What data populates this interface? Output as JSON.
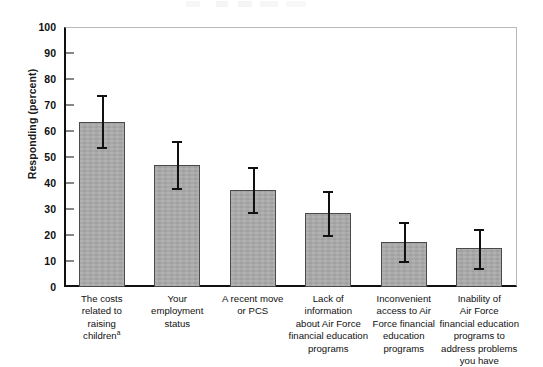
{
  "figure": {
    "y_axis_title": "Responding (percent)"
  },
  "chart_data": {
    "type": "bar",
    "title": "",
    "subtitle": "",
    "xlabel": "",
    "ylabel": "Responding (percent)",
    "ylim": [
      0,
      100
    ],
    "yticks": [
      0,
      10,
      20,
      30,
      40,
      50,
      60,
      70,
      80,
      90,
      100
    ],
    "ytick_labels": [
      "0",
      "10",
      "20",
      "30",
      "40",
      "50",
      "60",
      "70",
      "80",
      "90",
      "100"
    ],
    "grid": false,
    "legend": "none",
    "bar_color": "#a9a9a9",
    "bar_edge_color": "#4a4a4a",
    "error_bar_color": "#111111",
    "categories": [
      "The costs related to raising children",
      "Your employment status",
      "A recent move or PCS",
      "Lack of information about Air Force financial education programs",
      "Inconvenient access to Air Force financial education programs",
      "Inability of Air Force financial education programs to address problems you have"
    ],
    "category_lines": [
      [
        "The costs",
        "related to",
        "raising",
        "children"
      ],
      [
        "Your",
        "employment",
        "status"
      ],
      [
        "A recent move",
        "or PCS"
      ],
      [
        "Lack of",
        "information",
        "about Air Force",
        "financial education",
        "programs"
      ],
      [
        "Inconvenient",
        "access to Air",
        "Force financial",
        "education",
        "programs"
      ],
      [
        "Inability of",
        "Air Force",
        "financial education",
        "programs to",
        "address problems",
        "you have"
      ]
    ],
    "footnote_markers": [
      "a",
      "",
      "",
      "",
      "",
      ""
    ],
    "values": [
      63.5,
      47,
      37.5,
      28.5,
      17.5,
      15
    ],
    "error_low": [
      54,
      38,
      29,
      20,
      10,
      7.5
    ],
    "error_high": [
      74,
      56,
      46,
      37,
      25,
      22.5
    ]
  }
}
